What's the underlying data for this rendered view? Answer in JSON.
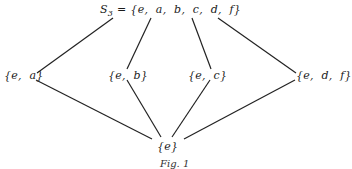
{
  "diagram": {
    "type": "subgroup-lattice",
    "nodes": [
      {
        "id": "top",
        "label_prefix": "S",
        "label_sub": "3",
        "label_rest": " = {e,  a,  b,  c,  d,  f}"
      },
      {
        "id": "ea",
        "label": "{e,  a}"
      },
      {
        "id": "eb",
        "label": "{e,  b}"
      },
      {
        "id": "ec",
        "label": "{e,  c}"
      },
      {
        "id": "edf",
        "label": "{e,  d,  f}"
      },
      {
        "id": "e",
        "label": "{e}"
      }
    ],
    "edges": [
      {
        "from": "top",
        "to": "ea"
      },
      {
        "from": "top",
        "to": "eb"
      },
      {
        "from": "top",
        "to": "ec"
      },
      {
        "from": "top",
        "to": "edf"
      },
      {
        "from": "ea",
        "to": "e"
      },
      {
        "from": "eb",
        "to": "e"
      },
      {
        "from": "ec",
        "to": "e"
      },
      {
        "from": "edf",
        "to": "e"
      }
    ],
    "caption": "Fig. 1"
  }
}
